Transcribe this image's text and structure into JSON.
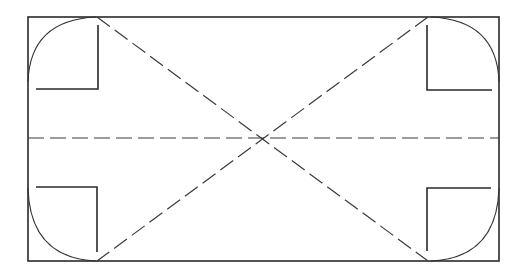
{
  "diagram": {
    "type": "screen-safe-area-layout",
    "canvas": {
      "width": 523,
      "height": 274,
      "background": "#ffffff"
    },
    "colors": {
      "stroke": "#2a2a2a",
      "dashed": "#3a3a3a"
    },
    "frame": {
      "x1": 28,
      "y1": 17,
      "x2": 499,
      "y2": 261
    },
    "corner_arcs": [
      {
        "corner": "top-left",
        "from": [
          28,
          82
        ],
        "to": [
          96,
          17
        ]
      },
      {
        "corner": "top-right",
        "from": [
          431,
          17
        ],
        "to": [
          499,
          82
        ]
      },
      {
        "corner": "bottom-left",
        "from": [
          28,
          188
        ],
        "to": [
          96,
          261
        ]
      },
      {
        "corner": "bottom-right",
        "from": [
          431,
          261
        ],
        "to": [
          499,
          188
        ]
      }
    ],
    "brackets": [
      {
        "corner": "top-left",
        "points": [
          [
            98,
            25
          ],
          [
            98,
            89
          ],
          [
            36,
            89
          ]
        ]
      },
      {
        "corner": "top-right",
        "points": [
          [
            427,
            25
          ],
          [
            427,
            90
          ],
          [
            492,
            90
          ]
        ]
      },
      {
        "corner": "bottom-left",
        "points": [
          [
            36,
            187
          ],
          [
            97,
            187
          ],
          [
            97,
            252
          ]
        ]
      },
      {
        "corner": "bottom-right",
        "points": [
          [
            491,
            188
          ],
          [
            427,
            188
          ],
          [
            427,
            251
          ]
        ]
      }
    ],
    "dashed_lines": [
      {
        "name": "diagonal-tl-br",
        "from": [
          97,
          17
        ],
        "to": [
          428,
          261
        ]
      },
      {
        "name": "diagonal-tr-bl",
        "from": [
          428,
          17
        ],
        "to": [
          97,
          261
        ]
      },
      {
        "name": "horizontal-centerline",
        "from": [
          28,
          138
        ],
        "to": [
          499,
          138
        ]
      }
    ],
    "center_point": [
      262,
      138
    ]
  }
}
